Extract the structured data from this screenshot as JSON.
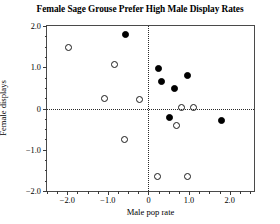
{
  "chart_data": {
    "type": "scatter",
    "title": "Female Sage Grouse Prefer High Male Display Rates",
    "xlabel": "Male pop rate",
    "ylabel": "Female displays",
    "xlim": [
      -2.5,
      2.6
    ],
    "ylim": [
      -2.0,
      2.0
    ],
    "xticks": [
      -2.0,
      -1.0,
      0,
      1.0,
      2.0
    ],
    "xticklabels": [
      "-2.0",
      "-1.0",
      "0",
      "1.0",
      "2.0"
    ],
    "yticks": [
      2.0,
      1.0,
      0,
      -1.0,
      -2.0
    ],
    "yticklabels": [
      "2.0",
      "1.0",
      "0",
      "-1.0",
      "-2.0"
    ],
    "grid": false,
    "reference_lines": {
      "horizontal": 0,
      "vertical": 0,
      "style": "dotted"
    },
    "legend": null,
    "series": [
      {
        "name": "closed-markers",
        "marker": "filled-circle",
        "color": "#000000",
        "points": [
          {
            "x": -0.56,
            "y": 1.79
          },
          {
            "x": 0.24,
            "y": 0.96
          },
          {
            "x": 0.32,
            "y": 0.65
          },
          {
            "x": 0.65,
            "y": 0.48
          },
          {
            "x": 0.95,
            "y": 0.81
          },
          {
            "x": 0.52,
            "y": -0.23
          },
          {
            "x": 1.81,
            "y": -0.28
          }
        ]
      },
      {
        "name": "open-markers",
        "marker": "open-circle",
        "color": "#1a1a1a",
        "points": [
          {
            "x": -1.98,
            "y": 1.49
          },
          {
            "x": -0.84,
            "y": 1.06
          },
          {
            "x": -1.08,
            "y": 0.25
          },
          {
            "x": -0.22,
            "y": 0.23
          },
          {
            "x": 0.82,
            "y": 0.03
          },
          {
            "x": 1.12,
            "y": 0.03
          },
          {
            "x": 0.69,
            "y": -0.4
          },
          {
            "x": -0.58,
            "y": -0.75
          },
          {
            "x": 0.22,
            "y": -1.66
          },
          {
            "x": 0.97,
            "y": -1.66
          }
        ]
      }
    ]
  }
}
